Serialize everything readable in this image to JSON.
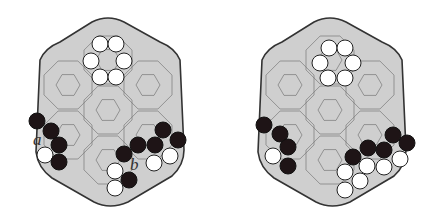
{
  "figure": {
    "panels": [
      {
        "id": "left",
        "offset_x": 0,
        "labels": [
          {
            "text": "a",
            "x": 33,
            "y": 145
          },
          {
            "text": "b",
            "x": 130,
            "y": 170
          }
        ],
        "stones": [
          {
            "color": "white",
            "x": 100,
            "y": 44
          },
          {
            "color": "white",
            "x": 116,
            "y": 44
          },
          {
            "color": "white",
            "x": 91,
            "y": 61
          },
          {
            "color": "white",
            "x": 124,
            "y": 61
          },
          {
            "color": "white",
            "x": 100,
            "y": 77
          },
          {
            "color": "white",
            "x": 116,
            "y": 77
          },
          {
            "color": "black",
            "x": 37,
            "y": 121
          },
          {
            "color": "black",
            "x": 51,
            "y": 131
          },
          {
            "color": "black",
            "x": 59,
            "y": 145
          },
          {
            "color": "white",
            "x": 45,
            "y": 155
          },
          {
            "color": "black",
            "x": 59,
            "y": 162
          },
          {
            "color": "black",
            "x": 124,
            "y": 154
          },
          {
            "color": "black",
            "x": 138,
            "y": 145
          },
          {
            "color": "black",
            "x": 155,
            "y": 145
          },
          {
            "color": "black",
            "x": 163,
            "y": 130
          },
          {
            "color": "black",
            "x": 178,
            "y": 140
          },
          {
            "color": "white",
            "x": 154,
            "y": 163
          },
          {
            "color": "white",
            "x": 170,
            "y": 156
          },
          {
            "color": "white",
            "x": 115,
            "y": 171
          },
          {
            "color": "black",
            "x": 129,
            "y": 180
          },
          {
            "color": "white",
            "x": 115,
            "y": 188
          }
        ]
      },
      {
        "id": "right",
        "offset_x": 222,
        "labels": [],
        "stones": [
          {
            "color": "white",
            "x": 329,
            "y": 48
          },
          {
            "color": "white",
            "x": 345,
            "y": 48
          },
          {
            "color": "white",
            "x": 320,
            "y": 63
          },
          {
            "color": "white",
            "x": 353,
            "y": 63
          },
          {
            "color": "white",
            "x": 328,
            "y": 78
          },
          {
            "color": "white",
            "x": 345,
            "y": 78
          },
          {
            "color": "black",
            "x": 264,
            "y": 125
          },
          {
            "color": "black",
            "x": 280,
            "y": 134
          },
          {
            "color": "black",
            "x": 288,
            "y": 147
          },
          {
            "color": "white",
            "x": 273,
            "y": 156
          },
          {
            "color": "black",
            "x": 288,
            "y": 166
          },
          {
            "color": "black",
            "x": 353,
            "y": 157
          },
          {
            "color": "black",
            "x": 368,
            "y": 148
          },
          {
            "color": "black",
            "x": 384,
            "y": 150
          },
          {
            "color": "black",
            "x": 393,
            "y": 135
          },
          {
            "color": "black",
            "x": 407,
            "y": 143
          },
          {
            "color": "white",
            "x": 345,
            "y": 172
          },
          {
            "color": "white",
            "x": 367,
            "y": 166
          },
          {
            "color": "white",
            "x": 384,
            "y": 167
          },
          {
            "color": "white",
            "x": 400,
            "y": 159
          },
          {
            "color": "white",
            "x": 360,
            "y": 181
          },
          {
            "color": "white",
            "x": 345,
            "y": 190
          }
        ]
      }
    ],
    "colors": {
      "board": "#cfcfcf",
      "outline": "#333333",
      "grid": "#777777",
      "black_stone": "#1e1416",
      "white_stone": "#ffffff"
    }
  }
}
